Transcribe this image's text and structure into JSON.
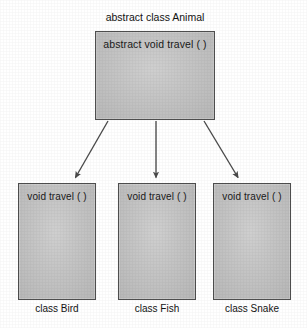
{
  "diagram": {
    "type": "uml-class-inheritance",
    "title_label": "abstract class Animal",
    "background_color": "#ffffff",
    "box_fill_color": "#c4c4c4",
    "box_border_color": "#4e4e4e",
    "arrow_color": "#4a4a4a",
    "text_color": "#1a1a1a"
  },
  "parent": {
    "caption": "abstract class Animal",
    "member": "abstract  void  travel ( )"
  },
  "children": [
    {
      "caption": "class Bird",
      "member": "void  travel ( )"
    },
    {
      "caption": "class Fish",
      "member": "void  travel ( )"
    },
    {
      "caption": "class Snake",
      "member": "void  travel ( )"
    }
  ],
  "arrows": [
    {
      "name": "animal-to-bird",
      "from": "abstract class Animal",
      "to": "class Bird",
      "style": "solid-line-filled-arrowhead"
    },
    {
      "name": "animal-to-fish",
      "from": "abstract class Animal",
      "to": "class Fish",
      "style": "solid-line-filled-arrowhead"
    },
    {
      "name": "animal-to-snake",
      "from": "abstract class Animal",
      "to": "class Snake",
      "style": "solid-line-filled-arrowhead"
    }
  ]
}
